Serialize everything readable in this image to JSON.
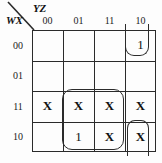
{
  "kmap": {
    "title": "Karnaugh map",
    "header": {
      "col_var": "YZ",
      "row_var": "WX",
      "diagonal_icon": "diagonal-divider-line"
    },
    "col_headers": [
      "00",
      "01",
      "11",
      "10"
    ],
    "row_headers": [
      "00",
      "01",
      "11",
      "10"
    ],
    "cells": [
      [
        "",
        "",
        "",
        "1"
      ],
      [
        "",
        "",
        "",
        ""
      ],
      [
        "X",
        "X",
        "X",
        "X"
      ],
      [
        "",
        "1",
        "X",
        "X"
      ]
    ],
    "groups": [
      {
        "name": "group-top-right-wrap",
        "cells": [
          "row00-col10"
        ],
        "shape": "open-top-wrap"
      },
      {
        "name": "group-center-quad",
        "cells": [
          "row11-col01",
          "row11-col11",
          "row10-col01",
          "row10-col11"
        ],
        "shape": "rounded-rect"
      },
      {
        "name": "group-bottom-right-wrap",
        "cells": [
          "row10-col10"
        ],
        "shape": "open-bottom-wrap"
      }
    ],
    "colors": {
      "grid_line": "#2a2a2a",
      "loop_line": "#2b2b2b",
      "text": "#111111",
      "background": "#fdfdfd"
    }
  }
}
